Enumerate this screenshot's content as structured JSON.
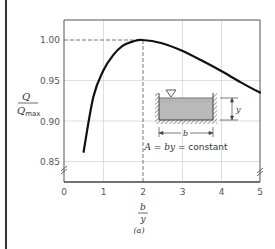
{
  "chart_data": {
    "type": "line",
    "title": "",
    "xlabel": "b/y",
    "xlabel_num": "b",
    "xlabel_den": "y",
    "ylabel": "Q/Q_max",
    "ylabel_num": "Q",
    "ylabel_den": "Q",
    "ylabel_den_sub": "max",
    "xlim": [
      0,
      5
    ],
    "ylim": [
      0.85,
      1.0
    ],
    "x_ticks": [
      "0",
      "1",
      "2",
      "3",
      "4",
      "5"
    ],
    "y_ticks": [
      "0.85",
      "0.90",
      "0.95",
      "1.00"
    ],
    "grid": true,
    "axis_break_marks": true,
    "series": [
      {
        "name": "Q/Qmax vs b/y",
        "x": [
          0.5,
          0.75,
          1.0,
          1.25,
          1.5,
          1.75,
          2.0,
          2.5,
          3.0,
          3.5,
          4.0,
          4.5,
          5.0
        ],
        "y": [
          0.862,
          0.93,
          0.962,
          0.981,
          0.993,
          0.998,
          1.0,
          0.996,
          0.987,
          0.975,
          0.962,
          0.948,
          0.935
        ]
      }
    ],
    "annotations": {
      "optimum_marker": {
        "x": 2,
        "y": 1.0,
        "style": "dashed guide lines"
      },
      "inset_caption": "A = by = constant",
      "inset_caption_parts": [
        "A",
        " = ",
        "by",
        " = constant"
      ],
      "inset_dim_width": "b",
      "inset_dim_depth": "y"
    },
    "panel_label": "(a)"
  }
}
